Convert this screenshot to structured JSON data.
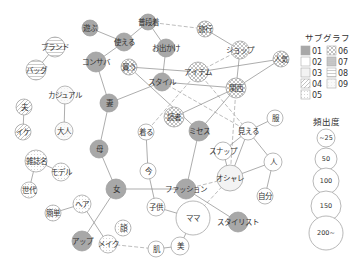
{
  "legend": {
    "subgraph_title": "サブグラフ",
    "subgraphs": [
      {
        "id": "01",
        "pattern": "p01"
      },
      {
        "id": "02",
        "pattern": "p02"
      },
      {
        "id": "03",
        "pattern": "p03"
      },
      {
        "id": "04",
        "pattern": "p04"
      },
      {
        "id": "05",
        "pattern": "p05"
      },
      {
        "id": "06",
        "pattern": "p06"
      },
      {
        "id": "07",
        "pattern": "p07"
      },
      {
        "id": "08",
        "pattern": "p08"
      },
      {
        "id": "09",
        "pattern": "p09"
      }
    ],
    "frequency_title": "頻出度",
    "frequencies": [
      {
        "label": "~25",
        "r": 9
      },
      {
        "label": "50",
        "r": 11
      },
      {
        "label": "100",
        "r": 13
      },
      {
        "label": "150",
        "r": 15
      },
      {
        "label": "200~",
        "r": 17
      }
    ]
  },
  "colors": {
    "edge": "#8a8a8a",
    "node_stroke": "#9a9a9a",
    "subgraph01": "#a8a8a8",
    "text": "#333333"
  },
  "nodes": [
    {
      "id": "asobu",
      "label": "遊ぶ",
      "x": 90,
      "y": 28,
      "r": 8,
      "g": "p01"
    },
    {
      "id": "tsukaeru",
      "label": "使える",
      "x": 124,
      "y": 42,
      "r": 9,
      "g": "p01"
    },
    {
      "id": "fudangi",
      "label": "普段着",
      "x": 148,
      "y": 22,
      "r": 8,
      "g": "p01"
    },
    {
      "id": "odekake",
      "label": "お出かけ",
      "x": 166,
      "y": 48,
      "r": 9,
      "g": "p01"
    },
    {
      "id": "konsaba",
      "label": "コンサバ",
      "x": 96,
      "y": 62,
      "r": 10,
      "g": "p01"
    },
    {
      "id": "kau",
      "label": "買う",
      "x": 129,
      "y": 67,
      "r": 8,
      "g": "p06"
    },
    {
      "id": "style",
      "label": "スタイル",
      "x": 162,
      "y": 82,
      "r": 9,
      "g": "p01"
    },
    {
      "id": "ryoko",
      "label": "旅行",
      "x": 205,
      "y": 29,
      "r": 8,
      "g": "p06"
    },
    {
      "id": "shop",
      "label": "ショップ",
      "x": 240,
      "y": 50,
      "r": 9,
      "g": "p06"
    },
    {
      "id": "ninki",
      "label": "人気",
      "x": 281,
      "y": 59,
      "r": 8,
      "g": "p06"
    },
    {
      "id": "item",
      "label": "アイテム",
      "x": 198,
      "y": 72,
      "r": 10,
      "g": "p06"
    },
    {
      "id": "kansai",
      "label": "関西",
      "x": 236,
      "y": 88,
      "r": 10,
      "g": "p06"
    },
    {
      "id": "dokusha",
      "label": "読者",
      "x": 174,
      "y": 117,
      "r": 10,
      "g": "p06"
    },
    {
      "id": "missus",
      "label": "ミセス",
      "x": 199,
      "y": 131,
      "r": 10,
      "g": "p01"
    },
    {
      "id": "kiru",
      "label": "着る",
      "x": 146,
      "y": 132,
      "r": 8,
      "g": "p02"
    },
    {
      "id": "mieru",
      "label": "見える",
      "x": 248,
      "y": 131,
      "r": 9,
      "g": "p02"
    },
    {
      "id": "fuku",
      "label": "服",
      "x": 275,
      "y": 118,
      "r": 8,
      "g": "p02"
    },
    {
      "id": "snap",
      "label": "スナップ",
      "x": 223,
      "y": 151,
      "r": 9,
      "g": "p02"
    },
    {
      "id": "hito",
      "label": "人",
      "x": 273,
      "y": 162,
      "r": 9,
      "g": "p02"
    },
    {
      "id": "oshare",
      "label": "オシャレ",
      "x": 230,
      "y": 178,
      "r": 13,
      "g": "p03"
    },
    {
      "id": "jibun",
      "label": "自分",
      "x": 265,
      "y": 196,
      "r": 8,
      "g": "p02"
    },
    {
      "id": "ima",
      "label": "今",
      "x": 148,
      "y": 171,
      "r": 8,
      "g": "p02"
    },
    {
      "id": "fashion",
      "label": "ファッション",
      "x": 186,
      "y": 189,
      "r": 10,
      "g": "p01"
    },
    {
      "id": "kodomo",
      "label": "子供",
      "x": 156,
      "y": 207,
      "r": 9,
      "g": "p02"
    },
    {
      "id": "mama",
      "label": "ママ",
      "x": 193,
      "y": 218,
      "r": 17,
      "g": "p02"
    },
    {
      "id": "stylist",
      "label": "スタイリスト",
      "x": 238,
      "y": 222,
      "r": 10,
      "g": "p01"
    },
    {
      "id": "hada",
      "label": "肌",
      "x": 156,
      "y": 249,
      "r": 8,
      "g": "p02"
    },
    {
      "id": "bi",
      "label": "美",
      "x": 180,
      "y": 246,
      "r": 9,
      "g": "p02"
    },
    {
      "id": "tsuma",
      "label": "妻",
      "x": 109,
      "y": 103,
      "r": 9,
      "g": "p01"
    },
    {
      "id": "haha",
      "label": "母",
      "x": 99,
      "y": 149,
      "r": 9,
      "g": "p01"
    },
    {
      "id": "onna",
      "label": "女",
      "x": 116,
      "y": 189,
      "r": 10,
      "g": "p01"
    },
    {
      "id": "brand",
      "label": "ブランド",
      "x": 55,
      "y": 47,
      "r": 10,
      "g": "p08"
    },
    {
      "id": "bag",
      "label": "バッグ",
      "x": 36,
      "y": 70,
      "r": 10,
      "g": "p08"
    },
    {
      "id": "casual",
      "label": "カジュアル",
      "x": 65,
      "y": 95,
      "r": 9,
      "g": "p09"
    },
    {
      "id": "otona",
      "label": "大人",
      "x": 64,
      "y": 131,
      "r": 9,
      "g": "p09"
    },
    {
      "id": "otto",
      "label": "夫",
      "x": 24,
      "y": 107,
      "r": 8,
      "g": "p04"
    },
    {
      "id": "ike",
      "label": "イケ",
      "x": 23,
      "y": 132,
      "r": 8,
      "g": "p04"
    },
    {
      "id": "zasshimei",
      "label": "雑誌名",
      "x": 36,
      "y": 161,
      "r": 11,
      "g": "p05"
    },
    {
      "id": "model",
      "label": "モデル",
      "x": 61,
      "y": 172,
      "r": 9,
      "g": "p05"
    },
    {
      "id": "sedai",
      "label": "世代",
      "x": 29,
      "y": 190,
      "r": 8,
      "g": "p05"
    },
    {
      "id": "kantan",
      "label": "簡単",
      "x": 53,
      "y": 213,
      "r": 8,
      "g": "p05"
    },
    {
      "id": "hair",
      "label": "ヘア",
      "x": 82,
      "y": 204,
      "r": 9,
      "g": "p05"
    },
    {
      "id": "kao",
      "label": "顔",
      "x": 123,
      "y": 228,
      "r": 8,
      "g": "p05"
    },
    {
      "id": "make",
      "label": "メイク",
      "x": 108,
      "y": 244,
      "r": 9,
      "g": "p05"
    },
    {
      "id": "up",
      "label": "アップ",
      "x": 82,
      "y": 241,
      "r": 10,
      "g": "p01"
    }
  ],
  "edges": [
    {
      "a": "asobu",
      "b": "tsukaeru",
      "d": false
    },
    {
      "a": "tsukaeru",
      "b": "fudangi",
      "d": false
    },
    {
      "a": "tsukaeru",
      "b": "konsaba",
      "d": false
    },
    {
      "a": "fudangi",
      "b": "odekake",
      "d": false
    },
    {
      "a": "fudangi",
      "b": "ryoko",
      "d": true
    },
    {
      "a": "odekake",
      "b": "style",
      "d": false
    },
    {
      "a": "ryoko",
      "b": "shop",
      "d": false
    },
    {
      "a": "shop",
      "b": "kansai",
      "d": false
    },
    {
      "a": "shop",
      "b": "item",
      "d": true
    },
    {
      "a": "ninki",
      "b": "item",
      "d": false
    },
    {
      "a": "ninki",
      "b": "kansai",
      "d": false
    },
    {
      "a": "kau",
      "b": "item",
      "d": false
    },
    {
      "a": "kau",
      "b": "missus",
      "d": false
    },
    {
      "a": "style",
      "b": "tsuma",
      "d": false
    },
    {
      "a": "style",
      "b": "kansai",
      "d": false
    },
    {
      "a": "style",
      "b": "mieru",
      "d": true
    },
    {
      "a": "item",
      "b": "kiru",
      "d": true
    },
    {
      "a": "item",
      "b": "mieru",
      "d": true
    },
    {
      "a": "kansai",
      "b": "dokusha",
      "d": false
    },
    {
      "a": "kansai",
      "b": "missus",
      "d": false
    },
    {
      "a": "kansai",
      "b": "oshare",
      "d": true
    },
    {
      "a": "konsaba",
      "b": "tsuma",
      "d": false
    },
    {
      "a": "tsuma",
      "b": "haha",
      "d": false
    },
    {
      "a": "haha",
      "b": "onna",
      "d": false
    },
    {
      "a": "onna",
      "b": "fashion",
      "d": false
    },
    {
      "a": "onna",
      "b": "up",
      "d": false
    },
    {
      "a": "missus",
      "b": "fashion",
      "d": false
    },
    {
      "a": "kiru",
      "b": "ima",
      "d": false
    },
    {
      "a": "ima",
      "b": "kodomo",
      "d": false
    },
    {
      "a": "mieru",
      "b": "fuku",
      "d": false
    },
    {
      "a": "mieru",
      "b": "snap",
      "d": false
    },
    {
      "a": "mieru",
      "b": "oshare",
      "d": false
    },
    {
      "a": "mieru",
      "b": "hito",
      "d": false
    },
    {
      "a": "snap",
      "b": "oshare",
      "d": false
    },
    {
      "a": "hito",
      "b": "oshare",
      "d": false
    },
    {
      "a": "hito",
      "b": "jibun",
      "d": false
    },
    {
      "a": "oshare",
      "b": "fashion",
      "d": true
    },
    {
      "a": "oshare",
      "b": "mama",
      "d": true
    },
    {
      "a": "fashion",
      "b": "stylist",
      "d": false
    },
    {
      "a": "kodomo",
      "b": "mama",
      "d": false
    },
    {
      "a": "mama",
      "b": "bi",
      "d": false
    },
    {
      "a": "bi",
      "b": "hada",
      "d": false
    },
    {
      "a": "hada",
      "b": "make",
      "d": true
    },
    {
      "a": "hair",
      "b": "make",
      "d": false
    },
    {
      "a": "hair",
      "b": "kantan",
      "d": false
    },
    {
      "a": "brand",
      "b": "bag",
      "d": false
    },
    {
      "a": "casual",
      "b": "otona",
      "d": false
    },
    {
      "a": "otto",
      "b": "ike",
      "d": false
    },
    {
      "a": "zasshimei",
      "b": "model",
      "d": false
    },
    {
      "a": "zasshimei",
      "b": "sedai",
      "d": false
    }
  ]
}
